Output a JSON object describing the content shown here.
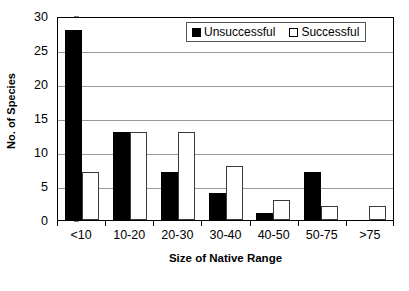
{
  "chart_data": {
    "type": "bar",
    "title": "",
    "subtitle": "",
    "xlabel": "Size of Native Range",
    "ylabel": "No. of Species",
    "categories": [
      "<10",
      "10-20",
      "20-30",
      "30-40",
      "40-50",
      "50-75",
      ">75"
    ],
    "series": [
      {
        "name": "Unsuccessful",
        "color": "#000000",
        "fill": "solid-black",
        "values": [
          28,
          13,
          7,
          4,
          1,
          7,
          0
        ]
      },
      {
        "name": "Successful",
        "color": "#ffffff",
        "fill": "open-white",
        "values": [
          7,
          13,
          13,
          8,
          3,
          2,
          2
        ]
      }
    ],
    "ylim": [
      0,
      30
    ],
    "ytick_step": 5,
    "yticks": [
      0,
      5,
      10,
      15,
      20,
      25,
      30
    ],
    "ytick_labels": [
      "0",
      "5",
      "10",
      "15",
      "20",
      "25",
      "30"
    ],
    "grid": {
      "horizontal": true,
      "vertical": false,
      "color": "#9a9a9a"
    },
    "legend": {
      "position": "top-right-inside",
      "bordered": true,
      "entries": [
        {
          "label": "Unsuccessful",
          "swatch": "filled"
        },
        {
          "label": "Successful",
          "swatch": "open"
        }
      ]
    },
    "axis_frame": true,
    "background": "#ffffff"
  }
}
